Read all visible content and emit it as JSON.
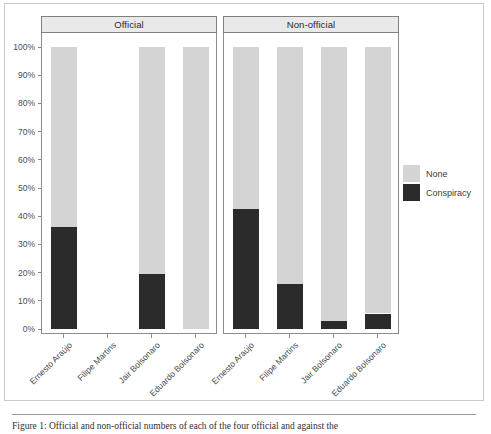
{
  "figure": {
    "caption": "Figure 1: Official and non-official numbers of the four official and против the",
    "caption_visible_fragment": "Figure 1: Official and non-official numbers of each of the four official and against the"
  },
  "legend": {
    "title": "",
    "entries": [
      {
        "label": "None",
        "color": "#d4d4d4"
      },
      {
        "label": "Conspiracy",
        "color": "#2b2b2b"
      }
    ]
  },
  "axis": {
    "y_ticks": [
      "0%",
      "10%",
      "20%",
      "30%",
      "40%",
      "50%",
      "60%",
      "70%",
      "80%",
      "90%",
      "100%"
    ],
    "y_tick_values": [
      0,
      10,
      20,
      30,
      40,
      50,
      60,
      70,
      80,
      90,
      100
    ]
  },
  "chart_data": {
    "type": "bar",
    "title": "",
    "xlabel": "",
    "ylabel": "",
    "ylim": [
      0,
      100
    ],
    "grid": false,
    "stacked": true,
    "stack_mode": "percent",
    "legend_position": "right",
    "facets": [
      "Official",
      "Non-official"
    ],
    "categories": [
      "Ernesto Araújo",
      "Filipe Martins",
      "Jair Bolsonaro",
      "Eduardo Bolsonaro"
    ],
    "series": [
      {
        "name": "None",
        "color": "#d4d4d4"
      },
      {
        "name": "Conspiracy",
        "color": "#2b2b2b"
      }
    ],
    "panels": [
      {
        "facet": "Official",
        "bars": [
          {
            "category": "Ernesto Araújo",
            "conspiracy": 36,
            "none": 64,
            "present": true
          },
          {
            "category": "Filipe Martins",
            "conspiracy": 0,
            "none": 0,
            "present": false
          },
          {
            "category": "Jair Bolsonaro",
            "conspiracy": 19.5,
            "none": 80.5,
            "present": true
          },
          {
            "category": "Eduardo Bolsonaro",
            "conspiracy": 0,
            "none": 100,
            "present": true
          }
        ]
      },
      {
        "facet": "Non-official",
        "bars": [
          {
            "category": "Ernesto Araújo",
            "conspiracy": 42.5,
            "none": 57.5,
            "present": true
          },
          {
            "category": "Filipe Martins",
            "conspiracy": 16,
            "none": 84,
            "present": true
          },
          {
            "category": "Jair Bolsonaro",
            "conspiracy": 3,
            "none": 97,
            "present": true
          },
          {
            "category": "Eduardo Bolsonaro",
            "conspiracy": 5.5,
            "none": 94.5,
            "present": true
          }
        ]
      }
    ]
  }
}
